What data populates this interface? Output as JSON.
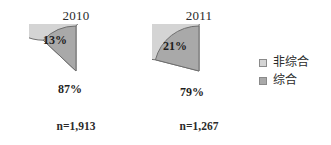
{
  "chart_data": {
    "type": "pie",
    "title": "",
    "charts": [
      {
        "title": "2010",
        "n_label": "n=1,913",
        "categories": [
          "非综合",
          "综合"
        ],
        "values": [
          87,
          13
        ],
        "labels": [
          "87%",
          "13%"
        ]
      },
      {
        "title": "2011",
        "n_label": "n=1,267",
        "categories": [
          "非综合",
          "综合"
        ],
        "values": [
          79,
          21
        ],
        "labels": [
          "79%",
          "21%"
        ]
      }
    ],
    "legend": {
      "position": "right",
      "entries": [
        {
          "label": "非综合",
          "color": "#d4d4d4"
        },
        {
          "label": "综合",
          "color": "#a9a9a9"
        }
      ]
    },
    "colors": {
      "non_comprehensive": "#d4d4d4",
      "comprehensive": "#a9a9a9",
      "outline": "#6e6e6e",
      "text": "#2b2b2b"
    },
    "grid": false,
    "xlabel": "",
    "ylabel": ""
  }
}
